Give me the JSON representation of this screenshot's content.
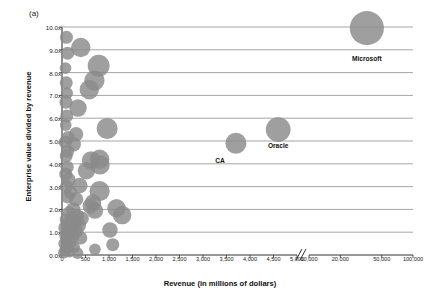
{
  "figure": {
    "panel_label": "(a)",
    "xlabel": "Revenue (in millions of dollars)",
    "ylabel": "Enterprise value divided by revenue"
  },
  "chart_data": {
    "type": "scatter",
    "title": "",
    "subtitle": "",
    "panel": "(a)",
    "xlabel": "Revenue (in millions of dollars)",
    "ylabel": "Enterprise value divided by revenue",
    "grid": "horizontal",
    "legend": "none",
    "bubble_note": "marker area scales with company size",
    "ylim": [
      0.0,
      10.0
    ],
    "ytick_labels": [
      "0.0x",
      "1.0x",
      "2.0x",
      "3.0x",
      "4.0x",
      "5.0x",
      "6.0x",
      "7.0x",
      "8.0x",
      "9.0x",
      "10.0x"
    ],
    "ytick_values": [
      0,
      1,
      2,
      3,
      4,
      5,
      6,
      7,
      8,
      9,
      10
    ],
    "xtick_labels": [
      "0",
      "500",
      "1,000",
      "1,500",
      "2,000",
      "2,500",
      "3,000",
      "3,500",
      "4,000",
      "4,500",
      "5,000",
      "10,000",
      "20,000",
      "50,000",
      "100,000"
    ],
    "xtick_values": [
      0,
      500,
      1000,
      1500,
      2000,
      2500,
      3000,
      3500,
      4000,
      4500,
      5000,
      10000,
      20000,
      50000,
      100000
    ],
    "axis_break": {
      "after": 5000,
      "before": 10000,
      "symbol": "//"
    },
    "annotations": [
      {
        "label": "Microsoft",
        "x": 36000,
        "y": 9.95,
        "size": 34
      },
      {
        "label": "Oracle",
        "x": 4600,
        "y": 5.5,
        "size": 18
      },
      {
        "label": "CA",
        "x": 3700,
        "y": 4.9,
        "size": 13
      }
    ],
    "points": [
      {
        "name": "Microsoft",
        "x": 36000,
        "y": 9.95,
        "size": 34
      },
      {
        "name": "Oracle",
        "x": 4600,
        "y": 5.5,
        "size": 18
      },
      {
        "name": "CA",
        "x": 3700,
        "y": 4.9,
        "size": 13
      },
      {
        "name": "",
        "x": 400,
        "y": 9.1,
        "size": 11
      },
      {
        "name": "",
        "x": 780,
        "y": 8.3,
        "size": 14
      },
      {
        "name": "",
        "x": 690,
        "y": 7.65,
        "size": 12
      },
      {
        "name": "",
        "x": 580,
        "y": 7.25,
        "size": 11
      },
      {
        "name": "",
        "x": 340,
        "y": 6.45,
        "size": 9
      },
      {
        "name": "",
        "x": 960,
        "y": 5.55,
        "size": 13
      },
      {
        "name": "",
        "x": 95,
        "y": 9.55,
        "size": 5
      },
      {
        "name": "",
        "x": 120,
        "y": 8.85,
        "size": 5
      },
      {
        "name": "",
        "x": 75,
        "y": 8.2,
        "size": 4
      },
      {
        "name": "",
        "x": 90,
        "y": 7.55,
        "size": 5
      },
      {
        "name": "",
        "x": 110,
        "y": 7.1,
        "size": 4
      },
      {
        "name": "",
        "x": 85,
        "y": 6.7,
        "size": 5
      },
      {
        "name": "",
        "x": 100,
        "y": 6.1,
        "size": 5
      },
      {
        "name": "",
        "x": 80,
        "y": 5.7,
        "size": 4
      },
      {
        "name": "",
        "x": 300,
        "y": 5.3,
        "size": 6
      },
      {
        "name": "",
        "x": 130,
        "y": 5.15,
        "size": 5
      },
      {
        "name": "",
        "x": 70,
        "y": 4.95,
        "size": 5
      },
      {
        "name": "",
        "x": 250,
        "y": 4.85,
        "size": 6
      },
      {
        "name": "",
        "x": 120,
        "y": 4.55,
        "size": 5
      },
      {
        "name": "",
        "x": 90,
        "y": 4.35,
        "size": 5
      },
      {
        "name": "",
        "x": 620,
        "y": 4.15,
        "size": 10
      },
      {
        "name": "",
        "x": 800,
        "y": 4.2,
        "size": 11
      },
      {
        "name": "",
        "x": 810,
        "y": 3.95,
        "size": 11
      },
      {
        "name": "",
        "x": 520,
        "y": 3.7,
        "size": 9
      },
      {
        "name": "",
        "x": 110,
        "y": 3.85,
        "size": 5
      },
      {
        "name": "",
        "x": 80,
        "y": 3.55,
        "size": 5
      },
      {
        "name": "",
        "x": 140,
        "y": 3.3,
        "size": 6
      },
      {
        "name": "",
        "x": 380,
        "y": 3.05,
        "size": 7
      },
      {
        "name": "",
        "x": 95,
        "y": 3.0,
        "size": 5
      },
      {
        "name": "",
        "x": 800,
        "y": 2.8,
        "size": 12
      },
      {
        "name": "",
        "x": 180,
        "y": 2.75,
        "size": 5
      },
      {
        "name": "",
        "x": 120,
        "y": 2.55,
        "size": 5
      },
      {
        "name": "",
        "x": 300,
        "y": 2.45,
        "size": 6
      },
      {
        "name": "",
        "x": 660,
        "y": 2.3,
        "size": 8
      },
      {
        "name": "",
        "x": 600,
        "y": 2.15,
        "size": 7
      },
      {
        "name": "",
        "x": 1160,
        "y": 2.05,
        "size": 10
      },
      {
        "name": "",
        "x": 700,
        "y": 1.95,
        "size": 8
      },
      {
        "name": "",
        "x": 1280,
        "y": 1.75,
        "size": 10
      },
      {
        "name": "",
        "x": 240,
        "y": 2.0,
        "size": 6
      },
      {
        "name": "",
        "x": 150,
        "y": 1.85,
        "size": 5
      },
      {
        "name": "",
        "x": 320,
        "y": 1.7,
        "size": 6
      },
      {
        "name": "",
        "x": 420,
        "y": 1.6,
        "size": 6
      },
      {
        "name": "",
        "x": 200,
        "y": 1.5,
        "size": 6
      },
      {
        "name": "",
        "x": 280,
        "y": 1.45,
        "size": 6
      },
      {
        "name": "",
        "x": 90,
        "y": 1.55,
        "size": 5
      },
      {
        "name": "",
        "x": 130,
        "y": 1.35,
        "size": 6
      },
      {
        "name": "",
        "x": 360,
        "y": 1.3,
        "size": 6
      },
      {
        "name": "",
        "x": 1020,
        "y": 1.1,
        "size": 7
      },
      {
        "name": "",
        "x": 60,
        "y": 1.2,
        "size": 5
      },
      {
        "name": "",
        "x": 210,
        "y": 1.15,
        "size": 6
      },
      {
        "name": "",
        "x": 300,
        "y": 1.05,
        "size": 6
      },
      {
        "name": "",
        "x": 140,
        "y": 0.95,
        "size": 6
      },
      {
        "name": "",
        "x": 80,
        "y": 0.85,
        "size": 5
      },
      {
        "name": "",
        "x": 230,
        "y": 0.8,
        "size": 5
      },
      {
        "name": "",
        "x": 400,
        "y": 0.75,
        "size": 5
      },
      {
        "name": "",
        "x": 110,
        "y": 0.65,
        "size": 5
      },
      {
        "name": "",
        "x": 180,
        "y": 0.55,
        "size": 5
      },
      {
        "name": "",
        "x": 60,
        "y": 0.5,
        "size": 5
      },
      {
        "name": "",
        "x": 1080,
        "y": 0.45,
        "size": 5
      },
      {
        "name": "",
        "x": 260,
        "y": 0.35,
        "size": 4
      },
      {
        "name": "",
        "x": 120,
        "y": 0.3,
        "size": 4
      },
      {
        "name": "",
        "x": 700,
        "y": 0.25,
        "size": 4
      },
      {
        "name": "",
        "x": 70,
        "y": 0.2,
        "size": 4
      },
      {
        "name": "",
        "x": 160,
        "y": 0.15,
        "size": 4
      },
      {
        "name": "",
        "x": 40,
        "y": 0.1,
        "size": 4
      },
      {
        "name": "",
        "x": 330,
        "y": 0.08,
        "size": 4
      }
    ]
  },
  "colors": {
    "bubble": "#8a8a8a",
    "gridline": "#808080",
    "axis": "#333333",
    "text": "#111111"
  }
}
